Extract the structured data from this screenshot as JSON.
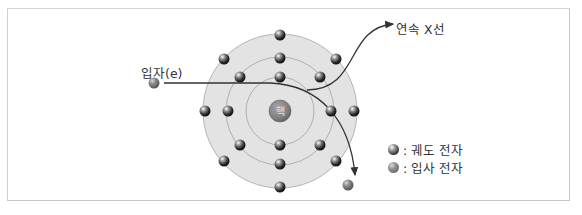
{
  "diagram": {
    "type": "atom-bremsstrahlung",
    "nucleus_label": "핵",
    "incident_particle_label": "입자(e)",
    "output_label": "연속 X선",
    "legend": [
      {
        "symbol": "orbital-electron",
        "label": ": 궤도 전자"
      },
      {
        "symbol": "incident-electron",
        "label": ": 입사 전자"
      }
    ],
    "orbits": 3,
    "colors": {
      "disc": "#e3e3e3",
      "orbit_line": "#b5b5b5",
      "nucleus": "#8a8a8a",
      "path": "#333333",
      "frame": "#c8c8c8"
    }
  }
}
